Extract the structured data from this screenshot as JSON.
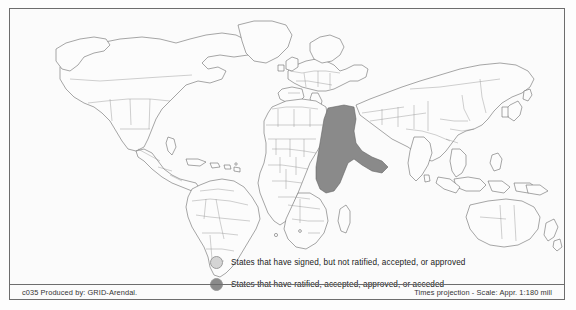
{
  "map": {
    "title": "",
    "projection_note": "Times projection - Scale: Appr. 1:180 mill",
    "credit": "c035 Produced by: GRID-Arendal.",
    "colors": {
      "signed_not_ratified": "#d4d4d4",
      "ratified": "#8a8a8a",
      "coastline": "#5e5e5e",
      "country_border": "#8d8d8d",
      "frame": "#6d6d6d",
      "land_fill": "#fcfcfc",
      "background": "#fdfdfd"
    }
  },
  "legend": {
    "items": [
      {
        "swatch": "signed-not-ratified-swatch",
        "color": "#d4d4d4",
        "label": "States that have signed, but not ratified, accepted, or approved"
      },
      {
        "swatch": "ratified-swatch",
        "color": "#8a8a8a",
        "label": "States that have ratified, accepted, approved, or acceded"
      }
    ]
  },
  "footer": {
    "left": "c035 Produced by: GRID-Arendal.",
    "right": "Times projection - Scale: Appr. 1:180 mill"
  }
}
